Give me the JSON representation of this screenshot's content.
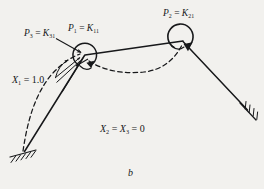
{
  "figure": {
    "caption": "b",
    "labels": {
      "p3": {
        "symbol": "P",
        "sub": "3",
        "equals": "=",
        "rhs": "K",
        "rhs_sub": "31",
        "text": "P3 = K31"
      },
      "p1": {
        "symbol": "P",
        "sub": "1",
        "equals": "=",
        "rhs": "K",
        "rhs_sub": "11",
        "text": "P1 = K11"
      },
      "p2": {
        "symbol": "P",
        "sub": "2",
        "equals": "=",
        "rhs": "K",
        "rhs_sub": "21",
        "text": "P2 = K21"
      },
      "x1": {
        "text": "X1 = 1.0",
        "symbol": "X",
        "sub": "1",
        "value": "1.0"
      },
      "x23": {
        "text": "X2 = X3 = 0",
        "symbol_a": "X",
        "sub_a": "2",
        "symbol_b": "X",
        "sub_b": "3",
        "value": "0"
      }
    },
    "colors": {
      "background": "#f2f1ee",
      "ink": "#17181a",
      "paper_shadow": "#d9d7d2"
    },
    "geometry": {
      "joints": {
        "left_support": [
          24,
          152
        ],
        "left_joint": [
          85,
          55
        ],
        "right_joint": [
          183,
          41
        ],
        "right_support": [
          248,
          110
        ]
      },
      "members": [
        {
          "name": "left-column",
          "from": [
            24,
            152
          ],
          "to": [
            85,
            55
          ]
        },
        {
          "name": "top-beam",
          "from": [
            85,
            55
          ],
          "to": [
            183,
            41
          ]
        },
        {
          "name": "right-column",
          "from": [
            183,
            41
          ],
          "to": [
            248,
            110
          ]
        }
      ],
      "deflected_shape": {
        "name": "deflected-shape",
        "path": "M 22 152 C 30 120 42 86 74 60 C 95 62 118 72 140 72 C 160 70 174 58 183 42"
      },
      "moments": [
        {
          "name": "moment-left-joint",
          "center": [
            85,
            54
          ],
          "radius": 11.5,
          "sense": "clockwise"
        },
        {
          "name": "moment-right-joint",
          "center": [
            181,
            38
          ],
          "radius": 12.5,
          "sense": "clockwise"
        }
      ],
      "rotation_arc": {
        "name": "unit-rotation-arc",
        "center": [
          85,
          55
        ],
        "radius": 33
      },
      "supports": [
        {
          "name": "fixed-support-left",
          "at": [
            24,
            152
          ],
          "angle": -12
        },
        {
          "name": "fixed-support-right",
          "at": [
            248,
            110
          ],
          "angle": -50
        }
      ],
      "leaders": [
        {
          "name": "leader-p3",
          "from": [
            57,
            39
          ],
          "to": [
            79,
            52
          ]
        },
        {
          "name": "leader-x1-upper",
          "from": [
            56,
            78
          ],
          "to": [
            82,
            59
          ]
        },
        {
          "name": "leader-x1-lower",
          "from": [
            56,
            82
          ],
          "to": [
            80,
            62
          ]
        }
      ]
    }
  }
}
